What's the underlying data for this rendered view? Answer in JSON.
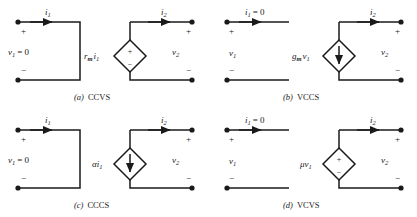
{
  "figure": {
    "background_color": "#ffffff",
    "stroke_color": "#1a1a1a",
    "panels": [
      {
        "id": "ccvs",
        "caption_letter": "(a)",
        "caption_text": "CCVS",
        "left_port": {
          "type": "short-circuit",
          "current_label": "i",
          "current_sub": "1",
          "voltage_label": "v",
          "voltage_sub": "1",
          "voltage_value": "= 0",
          "plus": "+",
          "minus": "−"
        },
        "right_port": {
          "current_label": "i",
          "current_sub": "2",
          "voltage_label": "v",
          "voltage_sub": "2",
          "plus": "+",
          "minus": "−"
        },
        "source": {
          "kind": "voltage",
          "symbol_plus": "+",
          "symbol_minus": "−",
          "gain_label": "r",
          "gain_sub": "m",
          "driver_label": "i",
          "driver_sub": "1"
        }
      },
      {
        "id": "vccs",
        "caption_letter": "(b)",
        "caption_text": "VCCS",
        "left_port": {
          "type": "open-circuit",
          "current_label": "i",
          "current_sub": "1",
          "current_value": "= 0",
          "voltage_label": "v",
          "voltage_sub": "1",
          "voltage_value": "",
          "plus": "+",
          "minus": "−"
        },
        "right_port": {
          "current_label": "i",
          "current_sub": "2",
          "voltage_label": "v",
          "voltage_sub": "2",
          "plus": "+",
          "minus": "−"
        },
        "source": {
          "kind": "current",
          "arrow_direction": "down",
          "gain_label": "g",
          "gain_sub": "m",
          "driver_label": "v",
          "driver_sub": "1"
        }
      },
      {
        "id": "cccs",
        "caption_letter": "(c)",
        "caption_text": "CCCS",
        "left_port": {
          "type": "short-circuit",
          "current_label": "i",
          "current_sub": "1",
          "voltage_label": "v",
          "voltage_sub": "1",
          "voltage_value": "= 0",
          "plus": "+",
          "minus": "−"
        },
        "right_port": {
          "current_label": "i",
          "current_sub": "2",
          "voltage_label": "v",
          "voltage_sub": "2",
          "plus": "+",
          "minus": "−"
        },
        "source": {
          "kind": "current",
          "arrow_direction": "down",
          "gain_label": "α",
          "gain_sub": "",
          "driver_label": "i",
          "driver_sub": "1"
        }
      },
      {
        "id": "vcvs",
        "caption_letter": "(d)",
        "caption_text": "VCVS",
        "left_port": {
          "type": "open-circuit",
          "current_label": "i",
          "current_sub": "1",
          "current_value": "= 0",
          "voltage_label": "v",
          "voltage_sub": "1",
          "voltage_value": "",
          "plus": "+",
          "minus": "−"
        },
        "right_port": {
          "current_label": "i",
          "current_sub": "2",
          "voltage_label": "v",
          "voltage_sub": "2",
          "plus": "+",
          "minus": "−"
        },
        "source": {
          "kind": "voltage",
          "symbol_plus": "+",
          "symbol_minus": "−",
          "gain_label": "μ",
          "gain_sub": "",
          "driver_label": "v",
          "driver_sub": "1"
        }
      }
    ]
  }
}
